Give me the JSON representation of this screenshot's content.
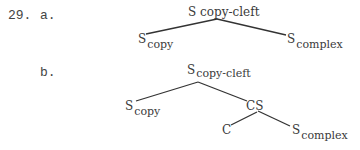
{
  "example": {
    "number": "29.",
    "a": {
      "label": "a.",
      "root": {
        "base": "S",
        "annotation": "copy-cleft"
      },
      "left": {
        "base": "S",
        "sub": "copy"
      },
      "right": {
        "base": "S",
        "sub": "complex"
      }
    },
    "b": {
      "label": "b.",
      "root": {
        "base": "S",
        "sub": "copy-cleft"
      },
      "left": {
        "base": "S",
        "sub": "copy"
      },
      "cs": {
        "base": "CS"
      },
      "c": {
        "base": "C"
      },
      "right": {
        "base": "S",
        "sub": "complex"
      }
    }
  }
}
